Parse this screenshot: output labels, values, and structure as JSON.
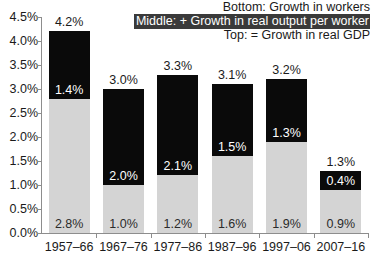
{
  "chart_data": {
    "type": "bar",
    "stacked": true,
    "title": "",
    "subtitle": "",
    "xlabel": "",
    "ylabel": "",
    "categories": [
      "1957–66",
      "1967–76",
      "1977–86",
      "1987–96",
      "1997–06",
      "2007–16"
    ],
    "series": [
      {
        "name": "Bottom: Growth in workers",
        "values": [
          2.8,
          1.0,
          1.2,
          1.6,
          1.9,
          0.9
        ],
        "labels": [
          "2.8%",
          "1.0%",
          "1.2%",
          "1.6%",
          "1.9%",
          "0.9%"
        ],
        "color": "#d4d4d4"
      },
      {
        "name": "Middle: + Growth in real output per worker",
        "values": [
          1.4,
          2.0,
          2.1,
          1.5,
          1.3,
          0.4
        ],
        "labels": [
          "1.4%",
          "2.0%",
          "2.1%",
          "1.5%",
          "1.3%",
          "0.4%"
        ],
        "color": "#0a0a0a"
      }
    ],
    "totals": [
      4.2,
      3.0,
      3.3,
      3.1,
      3.2,
      1.3
    ],
    "total_labels": [
      "4.2%",
      "3.0%",
      "3.3%",
      "3.1%",
      "3.2%",
      "1.3%"
    ],
    "ylim": [
      0.0,
      4.5
    ],
    "ytick_values": [
      0.0,
      0.5,
      1.0,
      1.5,
      2.0,
      2.5,
      3.0,
      3.5,
      4.0,
      4.5
    ],
    "ytick_labels": [
      "0.0%",
      "0.5%",
      "1.0%",
      "1.5%",
      "2.0%",
      "2.5%",
      "3.0%",
      "3.5%",
      "4.0%",
      "4.5%"
    ],
    "grid": false,
    "legend_position": "top-right"
  },
  "legend": {
    "lines": [
      {
        "text": "Bottom: Growth in workers",
        "style": "plain"
      },
      {
        "text": "Middle: + Growth in real output per worker",
        "style": "inverted"
      },
      {
        "text": "Top: = Growth in real GDP",
        "style": "plain"
      }
    ]
  },
  "colors": {
    "bar_bottom": "#d4d4d4",
    "bar_top": "#0a0a0a",
    "axis": "#8d8d8d",
    "text": "#1a1a1a",
    "legend_highlight_bg": "#3a3a3a",
    "legend_highlight_text": "#ffffff",
    "background": "#ffffff"
  }
}
